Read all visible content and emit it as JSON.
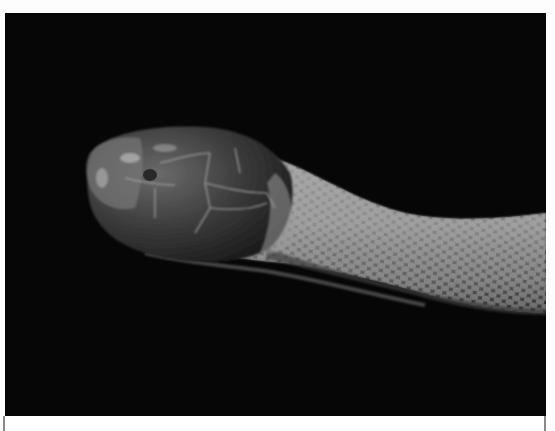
{
  "image": {
    "subject": "snake head in profile",
    "description": "Grayscale close-up of a snake's head and neck against a black background",
    "background_color": "#060606",
    "tone": "grayscale"
  },
  "caption": {
    "text": ""
  }
}
